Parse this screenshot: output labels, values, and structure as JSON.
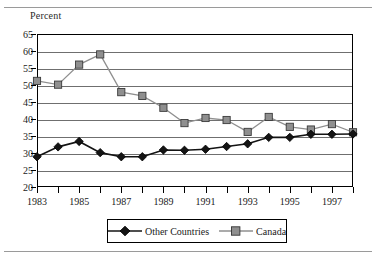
{
  "figure": {
    "ylabel": "Percent"
  },
  "chart_data": {
    "type": "line",
    "title": "",
    "subtitle": "",
    "xlabel": "",
    "ylabel": "Percent",
    "ylim": [
      20,
      65
    ],
    "ytick_values": [
      20,
      25,
      30,
      35,
      40,
      45,
      50,
      55,
      60,
      65
    ],
    "ytick_labels": [
      "20",
      "25",
      "30",
      "35",
      "40",
      "45",
      "50",
      "55",
      "60",
      "65"
    ],
    "grid": true,
    "grid_axis": "y",
    "legend_position": "bottom",
    "x": [
      1983,
      1984,
      1985,
      1986,
      1987,
      1988,
      1989,
      1990,
      1991,
      1992,
      1993,
      1994,
      1995,
      1996,
      1997,
      1998
    ],
    "xtick_values": [
      1983,
      1984,
      1985,
      1986,
      1987,
      1988,
      1989,
      1990,
      1991,
      1992,
      1993,
      1994,
      1995,
      1996,
      1997,
      1998
    ],
    "xtick_labels": [
      "1983",
      "",
      "1985",
      "",
      "1987",
      "",
      "1989",
      "",
      "1991",
      "",
      "1993",
      "",
      "1995",
      "",
      "1997",
      ""
    ],
    "xlim": [
      1983,
      1998
    ],
    "series": [
      {
        "name": "Other Countries",
        "color": "#141414",
        "marker": "diamond",
        "values": [
          28.9,
          31.8,
          33.4,
          30.1,
          28.9,
          28.9,
          30.9,
          30.8,
          31.1,
          31.9,
          32.7,
          34.6,
          34.6,
          35.5,
          35.5,
          35.6
        ]
      },
      {
        "name": "Canada",
        "color": "#8f8f8f",
        "marker": "square",
        "values": [
          51.2,
          50.1,
          56.0,
          59.0,
          47.9,
          46.8,
          43.3,
          38.8,
          40.3,
          39.7,
          36.2,
          40.6,
          37.7,
          36.9,
          38.5,
          36.1
        ]
      }
    ]
  },
  "legend": {
    "items": [
      {
        "label": "Other Countries"
      },
      {
        "label": "Canada"
      }
    ]
  }
}
